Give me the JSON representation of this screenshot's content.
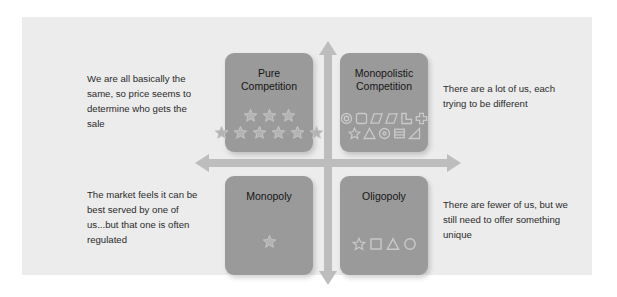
{
  "slide": {
    "background_color": "#ffffff",
    "canvas_color": "#ececec",
    "accent_color": "#bdbdbd",
    "box_color": "#9a9a9a",
    "shape_color": "#c9c9c9"
  },
  "axes": {
    "vertical_arrow": "double-headed-vertical-arrow",
    "horizontal_arrow": "double-headed-horizontal-arrow"
  },
  "quadrants": [
    {
      "id": "pure-competition",
      "title": "Pure\nCompetition",
      "title_line1": "Pure",
      "title_line2": "Competition",
      "shape_rows": [
        [
          "star",
          "star",
          "star"
        ],
        [
          "star",
          "star",
          "star",
          "star",
          "star"
        ]
      ]
    },
    {
      "id": "monopolistic-competition",
      "title": "Monopolistic\nCompetition",
      "title_line1": "Monopolistic",
      "title_line2": "Competition",
      "shape_rows": [
        [
          "donut",
          "rounded-square",
          "parallelogram",
          "parallelogram",
          "l-shape",
          "cross"
        ],
        [
          "star",
          "triangle",
          "circle-dot",
          "lined-rectangle",
          "right-triangle"
        ]
      ]
    },
    {
      "id": "monopoly",
      "title": "Monopoly",
      "title_line1": "Monopoly",
      "title_line2": "",
      "shape_rows": [
        [
          "star"
        ]
      ]
    },
    {
      "id": "oligopoly",
      "title": "Oligopoly",
      "title_line1": "Oligopoly",
      "title_line2": "",
      "shape_rows": [
        [
          "star",
          "square",
          "triangle",
          "circle"
        ]
      ]
    }
  ],
  "captions": {
    "top_left": "We are all basically the same, so price seems to determine who gets the sale",
    "bottom_left": "The market feels it can be best served by one of us...but that one is often regulated",
    "top_right": "There are a lot of us, each trying to be different",
    "bottom_right": "There are fewer of us, but we still need to offer something unique"
  }
}
